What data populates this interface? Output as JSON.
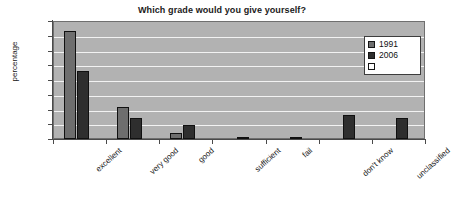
{
  "chart_data": {
    "type": "bar",
    "title": "Which grade would you give yourself?",
    "xlabel": "",
    "ylabel": "percentage",
    "ylim": [
      0,
      80
    ],
    "yticks": [
      0,
      10,
      20,
      30,
      40,
      50,
      60,
      70,
      80
    ],
    "grid": true,
    "legend_position": "top-right",
    "categories": [
      "excellent",
      "very good",
      "good",
      "sufficient",
      "fail",
      "don't know",
      "unclassified"
    ],
    "series": [
      {
        "name": "1991",
        "color": "#6e6e6e",
        "values": [
          73,
          22,
          4,
          0,
          0,
          0,
          0
        ]
      },
      {
        "name": "2006",
        "color": "#2e2e2e",
        "values": [
          46,
          14,
          9.5,
          0.7,
          0.7,
          16.5,
          14
        ]
      },
      {
        "name": "",
        "color": "#ffffff",
        "values": [
          0,
          0,
          0,
          0,
          0,
          0,
          0
        ]
      }
    ]
  },
  "legend": {
    "entries": [
      {
        "label": "1991",
        "color": "#6e6e6e"
      },
      {
        "label": "2006",
        "color": "#2e2e2e"
      },
      {
        "label": "",
        "color": "#ffffff"
      }
    ]
  }
}
